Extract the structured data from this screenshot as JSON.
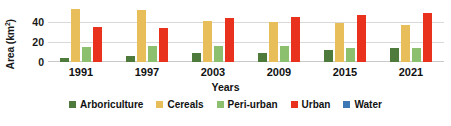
{
  "chart_data": {
    "type": "bar",
    "title": "",
    "xlabel": "Years",
    "ylabel": "Area (km2)",
    "ylabel_html": "Area (km²)",
    "categories": [
      "1991",
      "1997",
      "2003",
      "2009",
      "2015",
      "2021"
    ],
    "yticks": [
      0,
      20,
      40
    ],
    "ylim": [
      0,
      56
    ],
    "grid": true,
    "legend_position": "bottom",
    "series": [
      {
        "name": "Arboriculture",
        "color": "#4E7A3C",
        "values": [
          4,
          6,
          9,
          9,
          12,
          14
        ]
      },
      {
        "name": "Cereals",
        "color": "#E8BE5A",
        "values": [
          53,
          52,
          41,
          40,
          39,
          37
        ]
      },
      {
        "name": "Peri-urban",
        "color": "#8CBF6E",
        "values": [
          15,
          16,
          16,
          16,
          14,
          14
        ]
      },
      {
        "name": "Urban",
        "color": "#E8321E",
        "values": [
          35,
          34,
          44,
          45,
          47,
          49
        ]
      },
      {
        "name": "Water",
        "color": "#3C78B4",
        "values": [
          0,
          0,
          0,
          0,
          0,
          0
        ]
      }
    ]
  },
  "axis": {
    "ylabel": "Area (km",
    "ylabel_sup": "2",
    "ylabel_close": ")",
    "xlabel": "Years",
    "ytick_0": "0",
    "ytick_1": "20",
    "ytick_2": "40"
  },
  "legend": {
    "items": [
      {
        "label": "Arboriculture",
        "color": "#4E7A3C"
      },
      {
        "label": "Cereals",
        "color": "#E8BE5A"
      },
      {
        "label": "Peri-urban",
        "color": "#8CBF6E"
      },
      {
        "label": "Urban",
        "color": "#E8321E"
      },
      {
        "label": "Water",
        "color": "#3C78B4"
      }
    ]
  }
}
